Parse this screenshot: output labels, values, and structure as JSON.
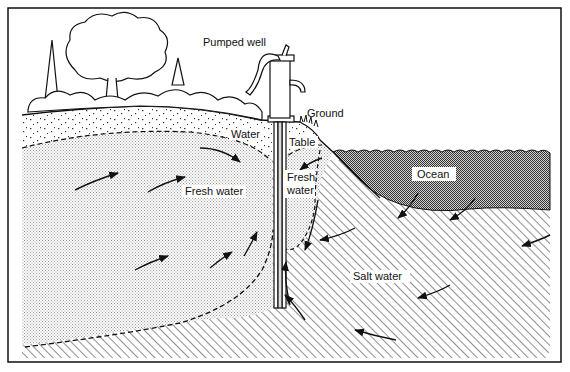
{
  "diagram": {
    "labels": {
      "pumped_well": "Pumped well",
      "ground": "Ground",
      "water": "Water",
      "table": "Table",
      "fresh_water_main": "Fresh water",
      "fresh_small_1": "Fresh",
      "fresh_small_2": "water",
      "ocean": "Ocean",
      "salt_water": "Salt water"
    },
    "regions": [
      {
        "name": "unsaturated-soil",
        "pattern": "sparse dots"
      },
      {
        "name": "fresh-water-lens",
        "pattern": "fine light stipple"
      },
      {
        "name": "salt-water",
        "pattern": "diagonal hatching"
      },
      {
        "name": "ocean",
        "pattern": "dark stipple"
      }
    ],
    "colors": {
      "ink": "#111111",
      "paper": "#ffffff",
      "fresh_stipple": "#c8c8c8",
      "ocean_stipple": "#6a6a6a"
    }
  }
}
